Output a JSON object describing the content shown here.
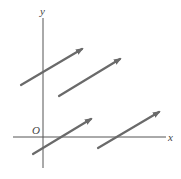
{
  "diagram": {
    "title": "",
    "colors": {
      "background": "#ffffff",
      "axis": "#555555",
      "vector": "#6a6a6a",
      "label": "#444444"
    },
    "axes": {
      "x_label": "x",
      "y_label": "y",
      "origin_label": "O",
      "x_axis": {
        "x1": 13,
        "y1": 137,
        "x2": 166,
        "y2": 137
      },
      "y_axis": {
        "x1": 43,
        "y1": 18,
        "x2": 43,
        "y2": 168
      }
    },
    "vectors": [
      {
        "id": "vector-1",
        "x1": 21,
        "y1": 85,
        "x2": 82,
        "y2": 49
      },
      {
        "id": "vector-2",
        "x1": 59,
        "y1": 96,
        "x2": 120,
        "y2": 59
      },
      {
        "id": "vector-3",
        "x1": 33,
        "y1": 154,
        "x2": 91,
        "y2": 119
      },
      {
        "id": "vector-4",
        "x1": 98,
        "y1": 148,
        "x2": 159,
        "y2": 112
      }
    ]
  }
}
